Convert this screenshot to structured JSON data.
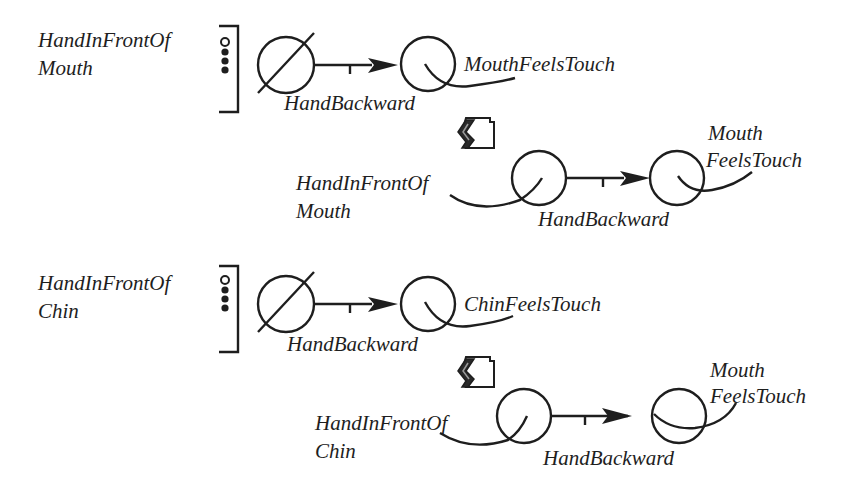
{
  "diagram": {
    "type": "action-transition-diagram",
    "rows": [
      {
        "condition": {
          "line1": "HandInFrontOf",
          "line2": "Mouth"
        },
        "rule": {
          "start_state": "empty-set",
          "action": "HandBackward",
          "result": "MouthFeelsTouch"
        },
        "expansion": {
          "start": {
            "line1": "HandInFrontOf",
            "line2": "Mouth"
          },
          "action": "HandBackward",
          "result": {
            "line1": "Mouth",
            "line2": "FeelsTouch"
          }
        }
      },
      {
        "condition": {
          "line1": "HandInFrontOf",
          "line2": "Chin"
        },
        "rule": {
          "start_state": "empty-set",
          "action": "HandBackward",
          "result": "ChinFeelsTouch"
        },
        "expansion": {
          "start": {
            "line1": "HandInFrontOf",
            "line2": "Chin"
          },
          "action": "HandBackward",
          "result": {
            "line1": "Mouth",
            "line2": "FeelsTouch"
          }
        }
      }
    ],
    "icons": {
      "condition_marker": "open-dot-over-filled-dots-icon",
      "bracket": "right-bracket-icon",
      "empty_state": "empty-set-icon",
      "transition_arrow": "arrow-with-tick-icon",
      "result_state": "q-loop-state-icon",
      "expansion_marker": "house-arrow-icon"
    }
  }
}
